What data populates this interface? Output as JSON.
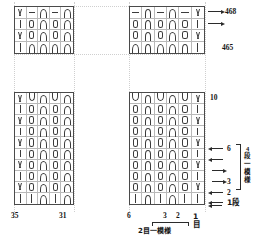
{
  "chart": {
    "kind": "knitting-stitch-chart",
    "symbol_legend": {
      "bar": "knit-stitch",
      "vee": "v-stitch",
      "dash": "purl-stitch",
      "cap": "arch-up",
      "cup": "arch-down",
      "loop": "elongated-loop"
    },
    "sections": {
      "upper": {
        "left_grid": {
          "columns": 5,
          "rows": 4,
          "cells": [
            [
              "vee",
              "dash",
              "cap",
              "dash",
              "cap"
            ],
            [
              "bar",
              "loop",
              "cap",
              "loop",
              "cap"
            ],
            [
              "vee",
              "loop",
              "cap",
              "loop",
              "cap"
            ],
            [
              "bar",
              "cap",
              "cap",
              "cap",
              "cap"
            ]
          ]
        },
        "right_grid": {
          "columns": 6,
          "rows": 4,
          "cells": [
            [
              "dash",
              "cap",
              "dash",
              "cap",
              "dash",
              "vee"
            ],
            [
              "loop",
              "cap",
              "loop",
              "cap",
              "loop",
              "bar"
            ],
            [
              "loop",
              "cap",
              "loop",
              "cap",
              "loop",
              "vee"
            ],
            [
              "cap",
              "cap",
              "cap",
              "cap",
              "cap",
              "bar"
            ]
          ]
        }
      },
      "lower": {
        "left_grid": {
          "columns": 5,
          "rows": 10,
          "cells": [
            [
              "vee",
              "cup",
              "cap",
              "cup",
              "cap"
            ],
            [
              "bar",
              "loop",
              "cap",
              "loop",
              "cap"
            ],
            [
              "vee",
              "loop",
              "cap",
              "loop",
              "cap"
            ],
            [
              "bar",
              "loop",
              "cap",
              "loop",
              "cap"
            ],
            [
              "vee",
              "loop",
              "cap",
              "loop",
              "cap"
            ],
            [
              "bar",
              "loop",
              "cap",
              "loop",
              "cap"
            ],
            [
              "vee",
              "loop",
              "cap",
              "loop",
              "cap"
            ],
            [
              "bar",
              "loop",
              "cap",
              "loop",
              "cap"
            ],
            [
              "vee",
              "loop",
              "cap",
              "loop",
              "cap"
            ],
            [
              "bar",
              "bar",
              "cap",
              "bar",
              "cap"
            ]
          ]
        },
        "right_grid": {
          "columns": 6,
          "rows": 10,
          "cells": [
            [
              "cup",
              "cap",
              "cup",
              "cap",
              "cup",
              "vee"
            ],
            [
              "loop",
              "cap",
              "loop",
              "cap",
              "loop",
              "bar"
            ],
            [
              "loop",
              "cap",
              "loop",
              "cap",
              "loop",
              "vee"
            ],
            [
              "loop",
              "cap",
              "loop",
              "cap",
              "loop",
              "bar"
            ],
            [
              "loop",
              "cap",
              "loop",
              "cap",
              "loop",
              "vee"
            ],
            [
              "loop",
              "cap",
              "loop",
              "cap",
              "loop",
              "bar"
            ],
            [
              "loop",
              "cap",
              "loop",
              "cap",
              "loop",
              "vee"
            ],
            [
              "loop",
              "cap",
              "loop",
              "cap",
              "loop",
              "bar"
            ],
            [
              "loop",
              "cap",
              "loop",
              "cap",
              "loop",
              "vee"
            ],
            [
              "bar",
              "cap",
              "bar",
              "cap",
              "bar",
              "bar"
            ]
          ]
        }
      }
    }
  },
  "row_labels": {
    "r468": "468",
    "r465": "465",
    "r10": "10",
    "r6": "6",
    "r3": "3",
    "r2": "2",
    "r1": "1段"
  },
  "stitch_labels": {
    "s35": "35",
    "s31": "31",
    "s6": "6",
    "s3": "3",
    "s2": "2",
    "s1": "1目"
  },
  "repeats": {
    "row_repeat_line1": "4",
    "row_repeat_line2": "段",
    "row_repeat_line3": "一",
    "row_repeat_line4": "模",
    "row_repeat_line5": "様",
    "stitch_repeat": "2目一模様"
  },
  "colors": {
    "grid_border": "#4a4a4a",
    "grid_line": "#b9b9b9",
    "symbol": "#3b3b3b",
    "text": "#151515",
    "guide": "#cfcfcf"
  }
}
